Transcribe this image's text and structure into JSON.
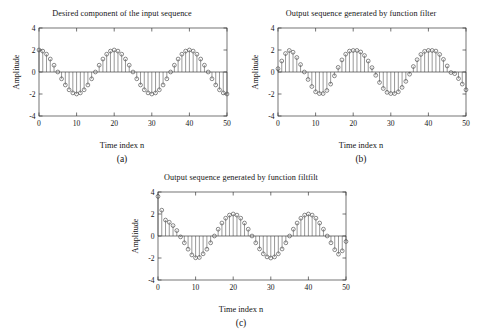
{
  "figure": {
    "background": "#ffffff",
    "axis_color": "#3a3a3a",
    "marker_color": "#3d3d3d"
  },
  "panels": [
    {
      "id": "panel-a",
      "title": "Desired component of the input sequence",
      "caption": "(a)",
      "xlabel": "Time index n",
      "ylabel": "Amplitude"
    },
    {
      "id": "panel-b",
      "title": "Output sequence generated by function filter",
      "caption": "(b)",
      "xlabel": "Time index n",
      "ylabel": "Amplitude"
    },
    {
      "id": "panel-c",
      "title": "Output sequence generated by function filtfilt",
      "caption": "(c)",
      "xlabel": "Time index n",
      "ylabel": "Amplitude"
    }
  ],
  "chart_data": [
    {
      "type": "scatter",
      "id": "panel-a",
      "title": "Desired component of the input sequence",
      "caption": "(a)",
      "xlabel": "Time index n",
      "ylabel": "Amplitude",
      "xlim": [
        0,
        50
      ],
      "ylim": [
        -4,
        4
      ],
      "xticks": [
        0,
        10,
        20,
        30,
        40,
        50
      ],
      "yticks": [
        4,
        2,
        0,
        -2,
        -4
      ],
      "xticklabels": [
        "0",
        "10",
        "20",
        "30",
        "40",
        "50"
      ],
      "yticklabels": [
        "4",
        "2",
        "0",
        "-2",
        "-4"
      ],
      "grid": false,
      "legend": "none",
      "marker": "circle-open",
      "stems": true,
      "x": [
        0,
        1,
        2,
        3,
        4,
        5,
        6,
        7,
        8,
        9,
        10,
        11,
        12,
        13,
        14,
        15,
        16,
        17,
        18,
        19,
        20,
        21,
        22,
        23,
        24,
        25,
        26,
        27,
        28,
        29,
        30,
        31,
        32,
        33,
        34,
        35,
        36,
        37,
        38,
        39,
        40,
        41,
        42,
        43,
        44,
        45,
        46,
        47,
        48,
        49,
        50
      ],
      "values": [
        2.0,
        1.9,
        1.62,
        1.18,
        0.62,
        0.0,
        -0.62,
        -1.18,
        -1.62,
        -1.9,
        -2.0,
        -1.9,
        -1.62,
        -1.18,
        -0.62,
        0.0,
        0.62,
        1.18,
        1.62,
        1.9,
        2.0,
        1.9,
        1.62,
        1.18,
        0.62,
        0.0,
        -0.62,
        -1.18,
        -1.62,
        -1.9,
        -2.0,
        -1.9,
        -1.62,
        -1.18,
        -0.62,
        0.0,
        0.62,
        1.18,
        1.62,
        1.9,
        2.0,
        1.9,
        1.62,
        1.18,
        0.62,
        0.0,
        -0.62,
        -1.18,
        -1.62,
        -1.9,
        -2.0
      ]
    },
    {
      "type": "scatter",
      "id": "panel-b",
      "title": "Output sequence generated by function filter",
      "caption": "(b)",
      "xlabel": "Time index n",
      "ylabel": "Amplitude",
      "xlim": [
        0,
        50
      ],
      "ylim": [
        -4,
        4
      ],
      "xticks": [
        0,
        10,
        20,
        30,
        40,
        50
      ],
      "yticks": [
        4,
        2,
        0,
        -2,
        -4
      ],
      "xticklabels": [
        "0",
        "10",
        "20",
        "30",
        "40",
        "50"
      ],
      "yticklabels": [
        "4",
        "2",
        "0",
        "-2",
        "-4"
      ],
      "grid": false,
      "legend": "none",
      "marker": "circle-open",
      "stems": true,
      "x": [
        0,
        1,
        2,
        3,
        4,
        5,
        6,
        7,
        8,
        9,
        10,
        11,
        12,
        13,
        14,
        15,
        16,
        17,
        18,
        19,
        20,
        21,
        22,
        23,
        24,
        25,
        26,
        27,
        28,
        29,
        30,
        31,
        32,
        33,
        34,
        35,
        36,
        37,
        38,
        39,
        40,
        41,
        42,
        43,
        44,
        45,
        46,
        47,
        48,
        49,
        50
      ],
      "values": [
        0.3,
        1.0,
        1.68,
        1.96,
        1.8,
        1.32,
        0.68,
        0.0,
        -0.68,
        -1.32,
        -1.8,
        -1.96,
        -1.96,
        -1.68,
        -1.1,
        -0.35,
        0.42,
        1.1,
        1.62,
        1.9,
        1.96,
        1.96,
        1.82,
        1.5,
        1.0,
        0.4,
        -0.3,
        -0.95,
        -1.5,
        -1.85,
        -1.96,
        -1.96,
        -1.8,
        -1.4,
        -0.85,
        -0.2,
        0.5,
        1.12,
        1.6,
        1.88,
        1.96,
        1.96,
        1.9,
        1.6,
        1.15,
        0.55,
        -0.05,
        -0.15,
        -0.6,
        -1.1,
        -1.62
      ]
    },
    {
      "type": "scatter",
      "id": "panel-c",
      "title": "Output sequence generated by function filtfilt",
      "caption": "(c)",
      "xlabel": "Time index n",
      "ylabel": "Amplitude",
      "xlim": [
        0,
        50
      ],
      "ylim": [
        -4,
        4
      ],
      "xticks": [
        0,
        10,
        20,
        30,
        40,
        50
      ],
      "yticks": [
        4,
        2,
        0,
        -2,
        -4
      ],
      "xticklabels": [
        "0",
        "10",
        "20",
        "30",
        "40",
        "50"
      ],
      "yticklabels": [
        "4",
        "2",
        "0",
        "-2",
        "-4"
      ],
      "grid": false,
      "legend": "none",
      "marker": "circle-open",
      "stems": true,
      "x": [
        0,
        1,
        2,
        3,
        4,
        5,
        6,
        7,
        8,
        9,
        10,
        11,
        12,
        13,
        14,
        15,
        16,
        17,
        18,
        19,
        20,
        21,
        22,
        23,
        24,
        25,
        26,
        27,
        28,
        29,
        30,
        31,
        32,
        33,
        34,
        35,
        36,
        37,
        38,
        39,
        40,
        41,
        42,
        43,
        44,
        45,
        46,
        47,
        48,
        49,
        50
      ],
      "values": [
        3.6,
        2.35,
        1.45,
        1.25,
        0.95,
        0.5,
        -0.08,
        -0.62,
        -1.2,
        -1.72,
        -1.98,
        -1.95,
        -1.62,
        -1.2,
        -0.62,
        0.0,
        0.62,
        1.18,
        1.62,
        1.9,
        2.0,
        1.9,
        1.62,
        1.18,
        0.62,
        0.0,
        -0.62,
        -1.18,
        -1.62,
        -1.9,
        -2.0,
        -1.9,
        -1.62,
        -1.18,
        -0.62,
        0.0,
        0.62,
        1.18,
        1.62,
        1.9,
        2.0,
        1.9,
        1.62,
        1.18,
        0.62,
        0.0,
        -0.62,
        -1.25,
        -1.65,
        -1.35,
        -0.5
      ]
    }
  ]
}
